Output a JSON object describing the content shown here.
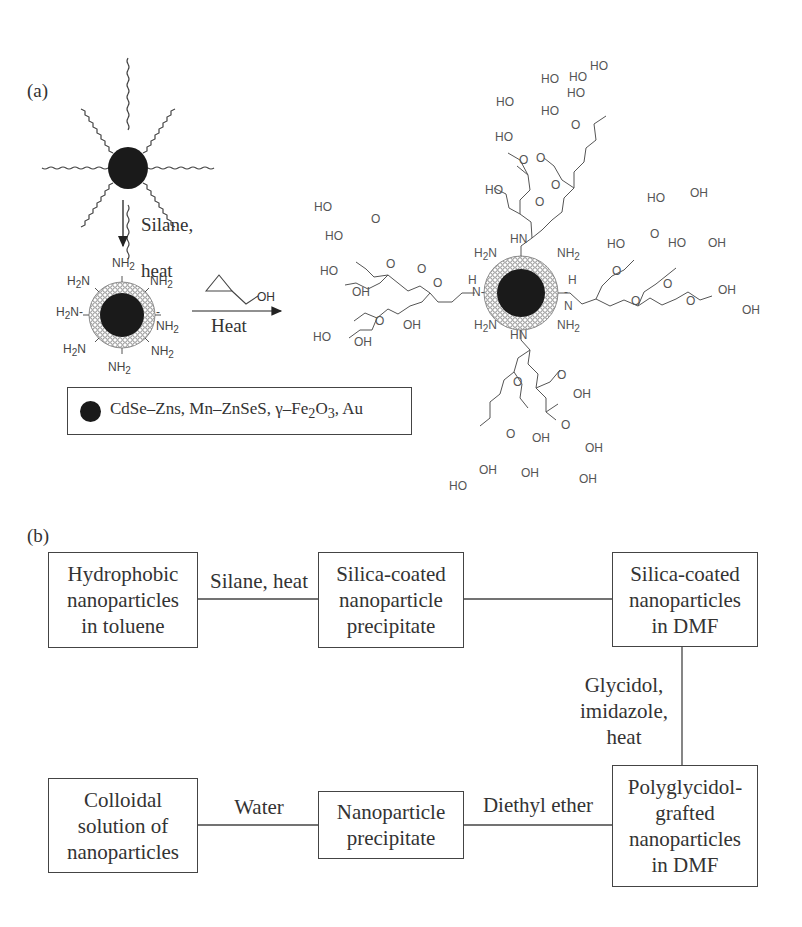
{
  "panel_a": {
    "label": "(a)",
    "step1_reagent_line1": "Silane,",
    "step1_reagent_line2": "heat",
    "step2_reagent": "Heat",
    "glycidol_OH": "OH",
    "amine_groups": [
      "NH2",
      "NH2",
      "NH2",
      "NH2",
      "H2N",
      "H2N",
      "H2N",
      "NH2"
    ],
    "legend": {
      "icon": "nanoparticle-core-dot",
      "text_parts": [
        "CdSe–Zns, Mn–ZnSeS, γ–Fe",
        "2",
        "O",
        "3",
        ", Au"
      ]
    },
    "product_labels": {
      "hydroxyl": "HO",
      "hydroxyl_right": "OH",
      "ether_oxygen": "O",
      "amine": "NH2",
      "amine_left": "H2N",
      "secondary_amine": "HN",
      "secondary_amine_h": "H",
      "secondary_amine_n": "N"
    }
  },
  "panel_b": {
    "label": "(b)",
    "boxes": [
      {
        "id": "hydrophobic",
        "text": "Hydrophobic\nnanoparticles\nin toluene"
      },
      {
        "id": "silica-precipitate",
        "text": "Silica-coated\nnanoparticle\nprecipitate"
      },
      {
        "id": "silica-dmf",
        "text": "Silica-coated\nnanoparticles\nin DMF"
      },
      {
        "id": "polyglycidol-dmf",
        "text": "Polyglycidol-\ngrafted\nnanoparticles\nin DMF"
      },
      {
        "id": "nanoparticle-precipitate",
        "text": "Nanoparticle\nprecipitate"
      },
      {
        "id": "colloidal",
        "text": "Colloidal\nsolution of\nnanoparticles"
      }
    ],
    "edges": [
      {
        "from": "hydrophobic",
        "to": "silica-precipitate",
        "label": "Silane, heat"
      },
      {
        "from": "silica-precipitate",
        "to": "silica-dmf",
        "label": ""
      },
      {
        "from": "silica-dmf",
        "to": "polyglycidol-dmf",
        "label": "Glycidol,\nimidazole,\nheat"
      },
      {
        "from": "polyglycidol-dmf",
        "to": "nanoparticle-precipitate",
        "label": "Diethyl ether"
      },
      {
        "from": "nanoparticle-precipitate",
        "to": "colloidal",
        "label": "Water"
      }
    ]
  },
  "colors": {
    "ink": "#333333",
    "core": "#1a1a1a",
    "shell": "#8a8a8a",
    "background": "#ffffff"
  }
}
